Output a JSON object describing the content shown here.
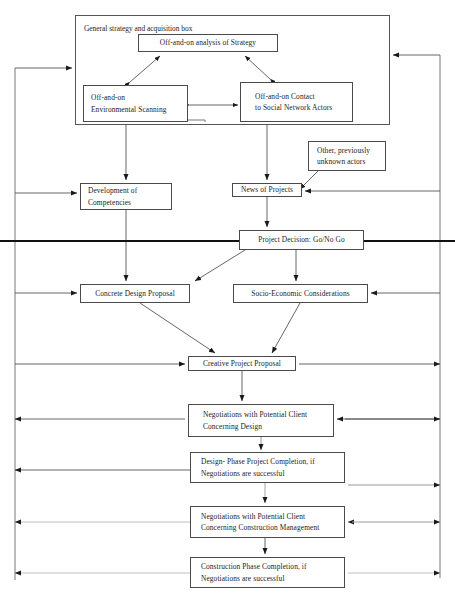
{
  "diagram": {
    "title": "General strategy and acquisition box",
    "container_label": "General strategy and acquisition box",
    "caption": "",
    "colors": {
      "box_border": "#4a4a4a",
      "line": "#555555",
      "thick_line": "#111111",
      "faint_line": "#cccccc",
      "text": "#222222",
      "background": "#ffffff"
    },
    "nodes": [
      {
        "id": "strategy-analysis",
        "label_lines": [
          "Off-and-on analysis of Strategy"
        ],
        "x": 138,
        "y": 34,
        "w": 140,
        "h": 18,
        "align": "center"
      },
      {
        "id": "environmental-scanning",
        "label_lines": [
          "Off-and-on",
          "Environmental Scanning"
        ],
        "x": 83,
        "y": 85,
        "w": 105,
        "h": 37,
        "align": "left"
      },
      {
        "id": "social-network-contact",
        "label_lines": [
          "Off-and-on Contact",
          "to Social Network Actors"
        ],
        "x": 240,
        "y": 82,
        "w": 113,
        "h": 40,
        "align": "indent"
      },
      {
        "id": "other-unknown-actors",
        "label_lines": [
          "Other, previously",
          "unknown actors"
        ],
        "x": 308,
        "y": 141,
        "w": 78,
        "h": 30,
        "align": "indent"
      },
      {
        "id": "development-competencies",
        "label_lines": [
          "Development of",
          "Competencies"
        ],
        "x": 80,
        "y": 183,
        "w": 92,
        "h": 27,
        "align": "left"
      },
      {
        "id": "news-of-projects",
        "label_lines": [
          "News of Projects"
        ],
        "x": 232,
        "y": 183,
        "w": 70,
        "h": 14,
        "align": "center"
      },
      {
        "id": "project-decision",
        "label_lines": [
          "Project Decision: Go/No Go"
        ],
        "x": 239,
        "y": 230,
        "w": 125,
        "h": 20,
        "align": "center"
      },
      {
        "id": "concrete-design-proposal",
        "label_lines": [
          "Concrete Design Proposal"
        ],
        "x": 80,
        "y": 284,
        "w": 110,
        "h": 19,
        "align": "center"
      },
      {
        "id": "socio-economic-considerations",
        "label_lines": [
          "Socio-Economic Considerations"
        ],
        "x": 233,
        "y": 284,
        "w": 135,
        "h": 19,
        "align": "center"
      },
      {
        "id": "creative-project-proposal",
        "label_lines": [
          "Creative Project Proposal"
        ],
        "x": 188,
        "y": 356,
        "w": 108,
        "h": 15,
        "align": "center"
      },
      {
        "id": "negotiations-design",
        "label_lines": [
          "Negotiations with Potential Client",
          "Concerning Design"
        ],
        "x": 188,
        "y": 404,
        "w": 146,
        "h": 33,
        "align": "indent"
      },
      {
        "id": "design-phase-completion",
        "label_lines": [
          "Design- Phase Project Completion, if",
          "Negotiations are successful"
        ],
        "x": 190,
        "y": 452,
        "w": 155,
        "h": 31,
        "align": "indent"
      },
      {
        "id": "negotiations-construction",
        "label_lines": [
          "Negotiations with Potential Client",
          "Concerning Construction Management"
        ],
        "x": 190,
        "y": 506,
        "w": 155,
        "h": 32,
        "align": "indent"
      },
      {
        "id": "construction-phase-completion",
        "label_lines": [
          "Construction Phase Completion, if",
          "Negotiations are successful"
        ],
        "x": 190,
        "y": 557,
        "w": 155,
        "h": 31,
        "align": "indent"
      }
    ],
    "edges": [
      {
        "id": "strategy-to-scanning",
        "type": "double-arrow"
      },
      {
        "id": "strategy-to-contact",
        "type": "double-arrow"
      },
      {
        "id": "scanning-to-contact",
        "type": "double-arrow"
      },
      {
        "id": "scanning-to-competencies",
        "type": "arrow-down"
      },
      {
        "id": "contact-to-news",
        "type": "arrow-down"
      },
      {
        "id": "unknown-actors-to-news",
        "type": "arrow-diagonal"
      },
      {
        "id": "news-to-decision",
        "type": "arrow-down"
      },
      {
        "id": "competencies-to-concrete",
        "type": "arrow-down"
      },
      {
        "id": "decision-to-concrete",
        "type": "arrow-diagonal"
      },
      {
        "id": "decision-to-socio",
        "type": "arrow-down"
      },
      {
        "id": "concrete-to-creative",
        "type": "arrow-diagonal"
      },
      {
        "id": "socio-to-creative",
        "type": "arrow-diagonal"
      },
      {
        "id": "creative-to-negotiations-design",
        "type": "arrow-down"
      },
      {
        "id": "negotiations-design-to-design-completion",
        "type": "arrow-down"
      },
      {
        "id": "design-completion-to-negotiations-construction",
        "type": "arrow-down"
      },
      {
        "id": "negotiations-construction-to-construction-completion",
        "type": "arrow-down"
      },
      {
        "id": "left-feedback-bus",
        "type": "feedback-line"
      },
      {
        "id": "right-feedback-bus",
        "type": "feedback-line"
      }
    ]
  }
}
